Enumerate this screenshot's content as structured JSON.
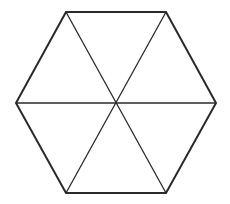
{
  "diagram": {
    "shape": "regular-hexagon",
    "stroke_color": "#2a2a2a",
    "background_color": "#ffffff",
    "outline_stroke_width": 2,
    "diagonal_stroke_width": 1.3,
    "center": {
      "x": 116,
      "y": 103
    },
    "vertices": [
      {
        "id": "top-left",
        "x": 66,
        "y": 12
      },
      {
        "id": "top-right",
        "x": 166,
        "y": 12
      },
      {
        "id": "right",
        "x": 216,
        "y": 103
      },
      {
        "id": "bottom-right",
        "x": 166,
        "y": 193
      },
      {
        "id": "bottom-left",
        "x": 66,
        "y": 193
      },
      {
        "id": "left",
        "x": 16,
        "y": 103
      }
    ],
    "diagonals": [
      {
        "from": "left",
        "to": "right"
      },
      {
        "from": "top-left",
        "to": "bottom-right"
      },
      {
        "from": "top-right",
        "to": "bottom-left"
      }
    ],
    "triangle_count": 6
  }
}
